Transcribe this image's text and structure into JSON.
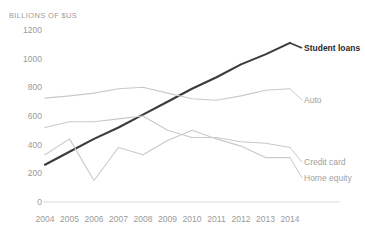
{
  "axis_unit_label": "BILLIONS OF $US",
  "series_labels": {
    "student_loans": "Student loans",
    "auto": "Auto",
    "credit_card": "Credit card",
    "home_equity": "Home equity"
  },
  "colors": {
    "student_loans": "#3b3b3b",
    "auto": "#c9c9c9",
    "credit_card": "#c9c9c9",
    "home_equity": "#c9c9c9",
    "axis": "#dcdcdc",
    "text": "#9a9a9a"
  },
  "chart_data": {
    "type": "line",
    "title": "",
    "subtitle": "",
    "xlabel": "",
    "ylabel": "BILLIONS OF $US",
    "ylim": [
      0,
      1200
    ],
    "ytick_values": [
      0,
      200,
      400,
      600,
      800,
      1000,
      1200
    ],
    "ytick_labels": [
      "0",
      "200",
      "400",
      "600",
      "800",
      "1000",
      "1200"
    ],
    "grid": false,
    "legend": "inline-right-end-labels",
    "categories": [
      2004,
      2005,
      2006,
      2007,
      2008,
      2009,
      2010,
      2011,
      2012,
      2013,
      2014
    ],
    "xtick_labels": [
      "2004",
      "2005",
      "2006",
      "2007",
      "2008",
      "2009",
      "2010",
      "2011",
      "2012",
      "2013",
      "2014"
    ],
    "series": [
      {
        "name": "Student loans",
        "emphasis": true,
        "values": [
          260,
          350,
          440,
          520,
          610,
          700,
          790,
          870,
          960,
          1030,
          1110
        ]
      },
      {
        "name": "Auto",
        "emphasis": false,
        "values": [
          725,
          740,
          760,
          790,
          800,
          760,
          720,
          710,
          740,
          780,
          790
        ]
      },
      {
        "name": "Credit card",
        "emphasis": false,
        "values": [
          520,
          560,
          560,
          580,
          600,
          500,
          450,
          450,
          420,
          410,
          380
        ]
      },
      {
        "name": "Home equity",
        "emphasis": false,
        "values": [
          330,
          440,
          150,
          380,
          330,
          430,
          500,
          440,
          390,
          310,
          310
        ]
      }
    ]
  }
}
